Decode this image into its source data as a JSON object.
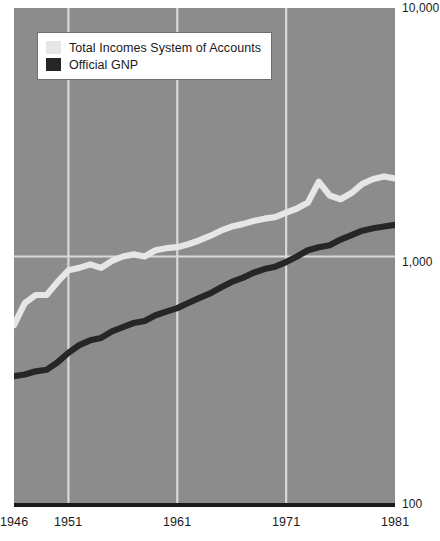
{
  "chart_data": {
    "type": "line",
    "title": "",
    "xlabel": "",
    "ylabel": "",
    "yscale": "log",
    "ylim": [
      100,
      10000
    ],
    "xlim": [
      1946,
      1981
    ],
    "grid": true,
    "legend_position": "top-left",
    "y_ticks": [
      "100",
      "1,000",
      "10,000"
    ],
    "x_ticks": [
      "1946",
      "1951",
      "1961",
      "1971",
      "1981"
    ],
    "x_gridlines": [
      1951,
      1961,
      1971
    ],
    "y_gridlines": [
      1000
    ],
    "x": [
      1946,
      1947,
      1948,
      1949,
      1950,
      1951,
      1952,
      1953,
      1954,
      1955,
      1956,
      1957,
      1958,
      1959,
      1960,
      1961,
      1962,
      1963,
      1964,
      1965,
      1966,
      1967,
      1968,
      1969,
      1970,
      1971,
      1972,
      1973,
      1974,
      1975,
      1976,
      1977,
      1978,
      1979,
      1980,
      1981
    ],
    "series": [
      {
        "name": "Total Incomes System of Accounts",
        "color": "#e6e6e6",
        "values": [
          530,
          650,
          700,
          700,
          790,
          880,
          900,
          930,
          900,
          960,
          1000,
          1020,
          1000,
          1060,
          1080,
          1090,
          1120,
          1160,
          1210,
          1270,
          1320,
          1350,
          1390,
          1420,
          1440,
          1500,
          1560,
          1650,
          2000,
          1760,
          1700,
          1800,
          1960,
          2050,
          2100,
          2060
        ]
      },
      {
        "name": "Official GNP",
        "color": "#262626",
        "values": [
          330,
          335,
          345,
          350,
          375,
          410,
          440,
          460,
          470,
          500,
          520,
          540,
          550,
          580,
          600,
          620,
          650,
          680,
          710,
          750,
          790,
          820,
          860,
          890,
          910,
          950,
          1000,
          1060,
          1090,
          1110,
          1170,
          1220,
          1270,
          1300,
          1320,
          1340
        ]
      }
    ]
  },
  "legend": {
    "items": [
      {
        "label": "Total Incomes System of Accounts",
        "color": "#e6e6e6"
      },
      {
        "label": "Official GNP",
        "color": "#262626"
      }
    ]
  },
  "axes": {
    "y": {
      "top_label": "10,000",
      "mid_label": "1,000",
      "bottom_label": "100"
    },
    "x": {
      "labels": [
        "1946",
        "1951",
        "1961",
        "1971",
        "1981"
      ]
    }
  },
  "colors": {
    "panel_background": "#8c8c8c",
    "gridline": "#d9d9d9",
    "axis_rule": "#1a1a1a",
    "text": "#1a1a1a",
    "legend_background": "#ffffff",
    "legend_border": "#6f6f6f",
    "series_light": "#e6e6e6",
    "series_dark": "#262626"
  }
}
